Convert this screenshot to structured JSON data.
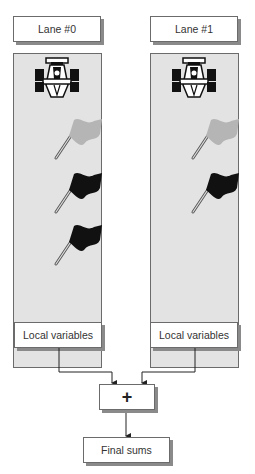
{
  "lanes": [
    {
      "label": "Lane #0",
      "local_label": "Local variables",
      "flags": [
        "gray",
        "black",
        "black"
      ]
    },
    {
      "label": "Lane #1",
      "local_label": "Local variables",
      "flags": [
        "gray",
        "black"
      ]
    }
  ],
  "combine": {
    "symbol": "+"
  },
  "result": {
    "label": "Final sums"
  },
  "colors": {
    "lane_bg": "#e3e3e3",
    "flag_gray": "#b5b5b5",
    "flag_black": "#111111",
    "border": "#6b6b6b"
  }
}
